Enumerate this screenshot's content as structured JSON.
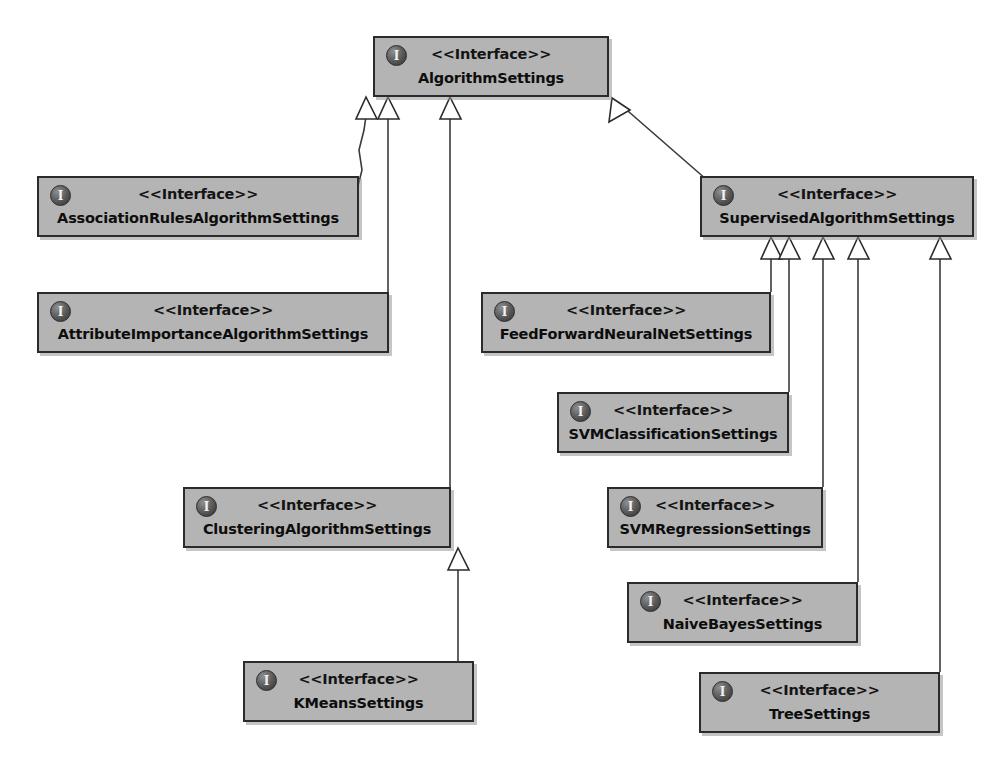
{
  "diagram": {
    "type": "uml-class-diagram",
    "background_color": "#ffffff",
    "box_fill_color": "#b4b4b4",
    "box_border_color": "#2b2b2b",
    "edge_color": "#3a3a3a",
    "stereotype_label": "<<Interface>>",
    "icon_glyph": "I",
    "icon_name": "interface-icon"
  },
  "nodes": [
    {
      "id": "algorithm-settings",
      "stereotype": "<<Interface>>",
      "name": "AlgorithmSettings",
      "x": 373,
      "y": 36,
      "w": 236,
      "h": 61
    },
    {
      "id": "association-rules-algorithm-settings",
      "stereotype": "<<Interface>>",
      "name": "AssociationRulesAlgorithmSettings",
      "x": 37,
      "y": 176,
      "w": 322,
      "h": 61
    },
    {
      "id": "supervised-algorithm-settings",
      "stereotype": "<<Interface>>",
      "name": "SupervisedAlgorithmSettings",
      "x": 700,
      "y": 176,
      "w": 274,
      "h": 61
    },
    {
      "id": "attribute-importance-algorithm-settings",
      "stereotype": "<<Interface>>",
      "name": "AttributeImportanceAlgorithmSettings",
      "x": 37,
      "y": 292,
      "w": 352,
      "h": 61
    },
    {
      "id": "feed-forward-neural-net-settings",
      "stereotype": "<<Interface>>",
      "name": "FeedForwardNeuralNetSettings",
      "x": 481,
      "y": 292,
      "w": 290,
      "h": 61
    },
    {
      "id": "svm-classification-settings",
      "stereotype": "<<Interface>>",
      "name": "SVMClassificationSettings",
      "x": 557,
      "y": 392,
      "w": 232,
      "h": 61
    },
    {
      "id": "clustering-algorithm-settings",
      "stereotype": "<<Interface>>",
      "name": "ClusteringAlgorithmSettings",
      "x": 183,
      "y": 487,
      "w": 268,
      "h": 61
    },
    {
      "id": "svm-regression-settings",
      "stereotype": "<<Interface>>",
      "name": "SVMRegressionSettings",
      "x": 607,
      "y": 487,
      "w": 216,
      "h": 61
    },
    {
      "id": "naive-bayes-settings",
      "stereotype": "<<Interface>>",
      "name": "NaiveBayesSettings",
      "x": 627,
      "y": 582,
      "w": 231,
      "h": 61
    },
    {
      "id": "k-means-settings",
      "stereotype": "<<Interface>>",
      "name": "KMeansSettings",
      "x": 243,
      "y": 661,
      "w": 231,
      "h": 61
    },
    {
      "id": "tree-settings",
      "stereotype": "<<Interface>>",
      "name": "TreeSettings",
      "x": 699,
      "y": 672,
      "w": 241,
      "h": 61
    }
  ],
  "edges": [
    {
      "from": "association-rules-algorithm-settings",
      "to": "algorithm-settings",
      "type": "generalization"
    },
    {
      "from": "attribute-importance-algorithm-settings",
      "to": "algorithm-settings",
      "type": "generalization"
    },
    {
      "from": "clustering-algorithm-settings",
      "to": "algorithm-settings",
      "type": "generalization"
    },
    {
      "from": "supervised-algorithm-settings",
      "to": "algorithm-settings",
      "type": "generalization"
    },
    {
      "from": "k-means-settings",
      "to": "clustering-algorithm-settings",
      "type": "generalization"
    },
    {
      "from": "feed-forward-neural-net-settings",
      "to": "supervised-algorithm-settings",
      "type": "generalization"
    },
    {
      "from": "svm-classification-settings",
      "to": "supervised-algorithm-settings",
      "type": "generalization"
    },
    {
      "from": "svm-regression-settings",
      "to": "supervised-algorithm-settings",
      "type": "generalization"
    },
    {
      "from": "naive-bayes-settings",
      "to": "supervised-algorithm-settings",
      "type": "generalization"
    },
    {
      "from": "tree-settings",
      "to": "supervised-algorithm-settings",
      "type": "generalization"
    }
  ]
}
